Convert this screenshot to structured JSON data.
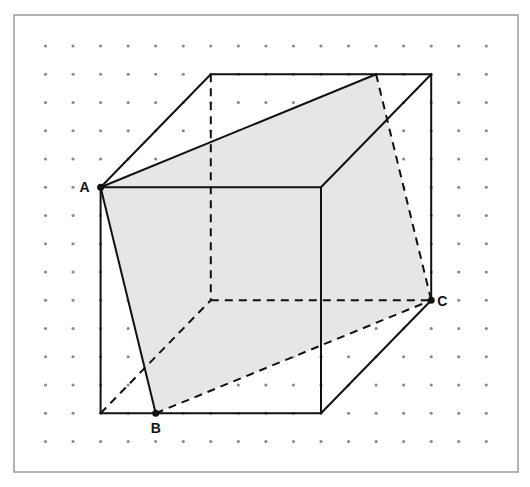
{
  "figure": {
    "grid": {
      "columns": 17,
      "rows": 15,
      "x0": 45.5,
      "dx": 27.55,
      "y0": 46,
      "dy": 28.25
    },
    "colors": {
      "section_fill": "#e6e6e6",
      "edge": "#111111",
      "dot": "#8a8a8a",
      "frame": "#9a9a9a"
    },
    "cube": {
      "front_face": {
        "top_left": [
          2,
          5
        ],
        "top_right": [
          10,
          5
        ],
        "bottom_right": [
          10,
          13
        ],
        "bottom_left": [
          2,
          13
        ]
      },
      "back_face": {
        "top_left": [
          6,
          1
        ],
        "top_right": [
          14,
          1
        ],
        "bottom_right": [
          14,
          9
        ],
        "bottom_left": [
          6,
          9
        ]
      }
    },
    "points": [
      {
        "name": "A",
        "grid": [
          2,
          5
        ],
        "label": "A",
        "label_pos": "left"
      },
      {
        "name": "B",
        "grid": [
          4,
          13
        ],
        "label": "B",
        "label_pos": "below"
      },
      {
        "name": "C",
        "grid": [
          14,
          9
        ],
        "label": "C",
        "label_pos": "right"
      }
    ],
    "section_polygon": [
      [
        2,
        5
      ],
      [
        12,
        1
      ],
      [
        14,
        9
      ],
      [
        4,
        13
      ]
    ]
  }
}
